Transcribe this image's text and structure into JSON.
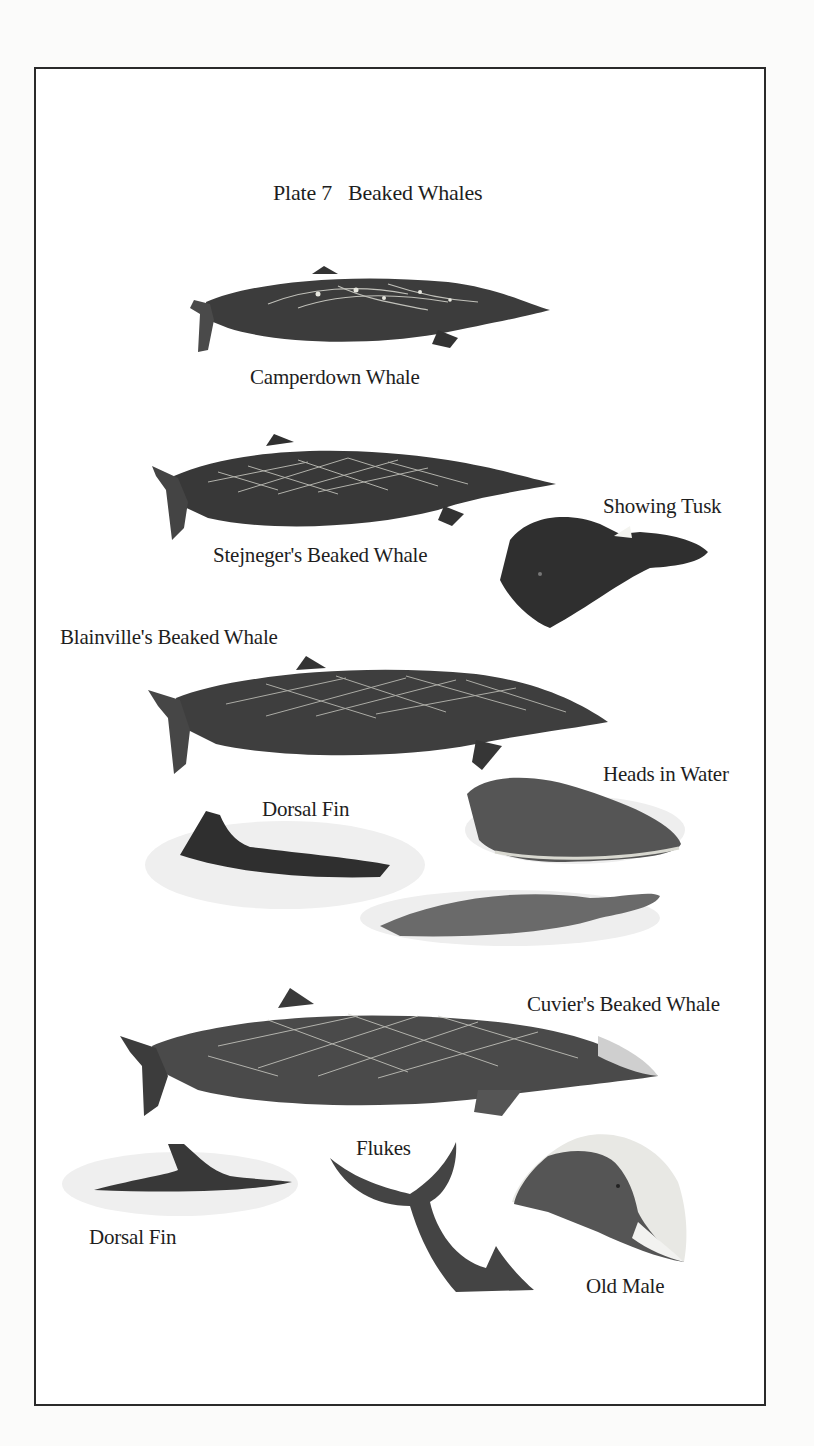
{
  "plate": {
    "title": "Plate 7   Beaked Whales",
    "number": "7",
    "subject": "Beaked Whales"
  },
  "labels": {
    "camperdown": "Camperdown Whale",
    "stejneger": "Stejneger's Beaked Whale",
    "showing_tusk": "Showing Tusk",
    "blainville": "Blainville's Beaked Whale",
    "heads_in_water": "Heads in Water",
    "dorsal_fin_1": "Dorsal Fin",
    "cuvier": "Cuvier's Beaked Whale",
    "flukes": "Flukes",
    "dorsal_fin_2": "Dorsal Fin",
    "old_male": "Old Male"
  },
  "colors": {
    "frame": "#2a2a2a",
    "whale_dark": "#3a3a3a",
    "whale_mid": "#555555",
    "scar": "#d8d8d0",
    "water": "#e4e4e4"
  }
}
